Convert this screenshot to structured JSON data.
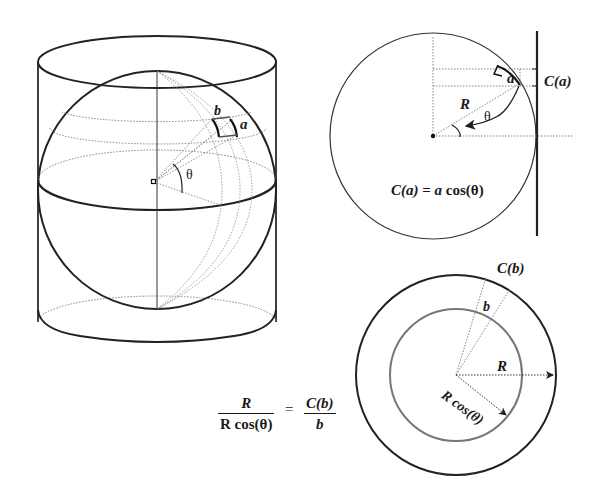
{
  "figure": {
    "colors": {
      "line": "#1f1f1f",
      "dotted": "#7a7a7a",
      "background": "#ffffff"
    }
  },
  "left_diagram": {
    "title": "sphere-in-cylinder",
    "labels": {
      "b": "b",
      "a": "a",
      "theta": "θ"
    }
  },
  "top_right_diagram": {
    "labels": {
      "a": "a",
      "R": "R",
      "theta": "θ",
      "Ca": "C(a)"
    },
    "equation": {
      "lhs": "C(a)",
      "eq": "=",
      "rhs_var": "a",
      "rhs_fn": "cos(θ)"
    }
  },
  "bottom_right_diagram": {
    "labels": {
      "Cb": "C(b)",
      "b": "b",
      "R": "R",
      "Rcos": "R cos(θ)"
    }
  },
  "ratio_equation": {
    "left_num": "R",
    "left_den": "R cos(θ)",
    "equals": "=",
    "right_num": "C(b)",
    "right_den": "b"
  }
}
